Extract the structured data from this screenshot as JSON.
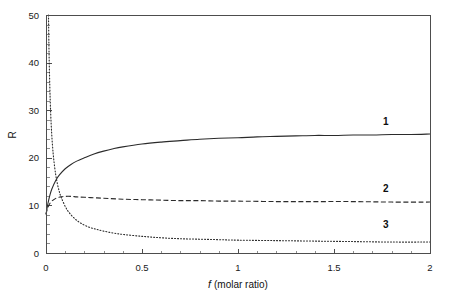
{
  "chart_data": {
    "type": "line",
    "title": "",
    "subtitle": "",
    "xlabel": "f (molar ratio)",
    "xlabel_italic_part": "f",
    "xlabel_rest": "(molar ratio)",
    "ylabel": "R",
    "xlim": [
      0,
      2
    ],
    "ylim": [
      0,
      50
    ],
    "x_major_ticks": [
      0,
      0.5,
      1,
      1.5,
      2
    ],
    "x_major_tick_labels": [
      "0",
      "0.5",
      "1",
      "1.5",
      "2"
    ],
    "x_minor_tick_step": 0.1,
    "y_major_ticks": [
      0,
      10,
      20,
      30,
      40,
      50
    ],
    "y_major_tick_labels": [
      "0",
      "10",
      "20",
      "30",
      "40",
      "50"
    ],
    "y_minor_tick_step": 2,
    "grid": false,
    "legend_position": "inline-right-annotations",
    "annotations": [
      {
        "text": "1",
        "x": 1.77,
        "y": 26.9,
        "bold": true
      },
      {
        "text": "2",
        "x": 1.77,
        "y": 12.8,
        "bold": true
      },
      {
        "text": "3",
        "x": 1.77,
        "y": 5.2,
        "bold": true
      }
    ],
    "series": [
      {
        "name": "1",
        "style": "solid",
        "color": "#2b2b2b",
        "x": [
          0,
          0.005,
          0.01,
          0.02,
          0.03,
          0.05,
          0.07,
          0.1,
          0.13,
          0.16,
          0.2,
          0.25,
          0.3,
          0.35,
          0.4,
          0.5,
          0.6,
          0.7,
          0.8,
          0.9,
          1.0,
          1.1,
          1.2,
          1.3,
          1.4,
          1.5,
          1.6,
          1.7,
          1.8,
          1.9,
          2.0
        ],
        "y": [
          8.1,
          9.3,
          10.4,
          12.1,
          13.4,
          15.2,
          16.4,
          17.7,
          18.6,
          19.3,
          20.0,
          20.8,
          21.4,
          21.9,
          22.3,
          22.9,
          23.3,
          23.6,
          23.9,
          24.1,
          24.2,
          24.4,
          24.5,
          24.6,
          24.7,
          24.7,
          24.8,
          24.8,
          24.9,
          24.9,
          25.0
        ]
      },
      {
        "name": "2",
        "style": "dashed",
        "color": "#2b2b2b",
        "x": [
          0,
          0.005,
          0.01,
          0.02,
          0.03,
          0.04,
          0.06,
          0.08,
          0.1,
          0.13,
          0.16,
          0.2,
          0.25,
          0.3,
          0.4,
          0.5,
          0.6,
          0.7,
          0.8,
          0.9,
          1.0,
          1.2,
          1.4,
          1.6,
          1.8,
          2.0
        ],
        "y": [
          8.1,
          9.0,
          9.6,
          10.4,
          10.9,
          11.2,
          11.6,
          11.8,
          11.9,
          11.9,
          11.8,
          11.7,
          11.6,
          11.5,
          11.3,
          11.2,
          11.1,
          11.0,
          11.0,
          10.9,
          10.9,
          10.8,
          10.8,
          10.8,
          10.7,
          10.7
        ]
      },
      {
        "name": "3",
        "style": "dotted",
        "color": "#4a4a4a",
        "x": [
          0.013,
          0.015,
          0.018,
          0.022,
          0.027,
          0.033,
          0.04,
          0.05,
          0.06,
          0.07,
          0.08,
          0.1,
          0.12,
          0.15,
          0.18,
          0.22,
          0.26,
          0.3,
          0.35,
          0.4,
          0.5,
          0.6,
          0.7,
          0.8,
          0.9,
          1.0,
          1.2,
          1.4,
          1.6,
          1.8,
          2.0
        ],
        "y": [
          50.0,
          44.0,
          38.0,
          32.0,
          27.0,
          23.0,
          19.8,
          16.6,
          14.4,
          12.8,
          11.6,
          9.8,
          8.5,
          7.2,
          6.3,
          5.5,
          5.0,
          4.6,
          4.2,
          3.9,
          3.5,
          3.2,
          3.0,
          2.9,
          2.8,
          2.7,
          2.6,
          2.5,
          2.4,
          2.3,
          2.3
        ]
      }
    ]
  },
  "figure": {
    "background_color": "#ffffff",
    "axis_color": "#4d4d4d",
    "text_color": "#111111"
  }
}
